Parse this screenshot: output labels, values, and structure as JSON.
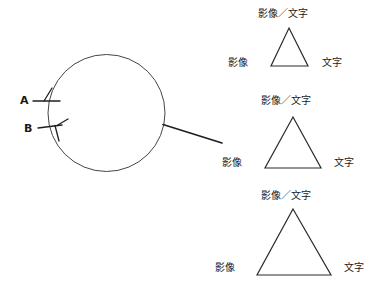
{
  "figure": {
    "title": "",
    "background_color": "#ffffff",
    "stroke_color": "#2b2b2b",
    "text_color": "#1a1a1a",
    "circle": {
      "label_a": "A",
      "label_b": "B"
    },
    "triangles": [
      {
        "id": "triangle-small",
        "apex_label": "影像／文字",
        "left_label": "影像",
        "right_label": "文字"
      },
      {
        "id": "triangle-medium",
        "apex_label": "影像／文字",
        "left_label": "影像",
        "right_label": "文字"
      },
      {
        "id": "triangle-large",
        "apex_label": "影像／文字",
        "left_label": "影像",
        "right_label": "文字"
      }
    ]
  }
}
